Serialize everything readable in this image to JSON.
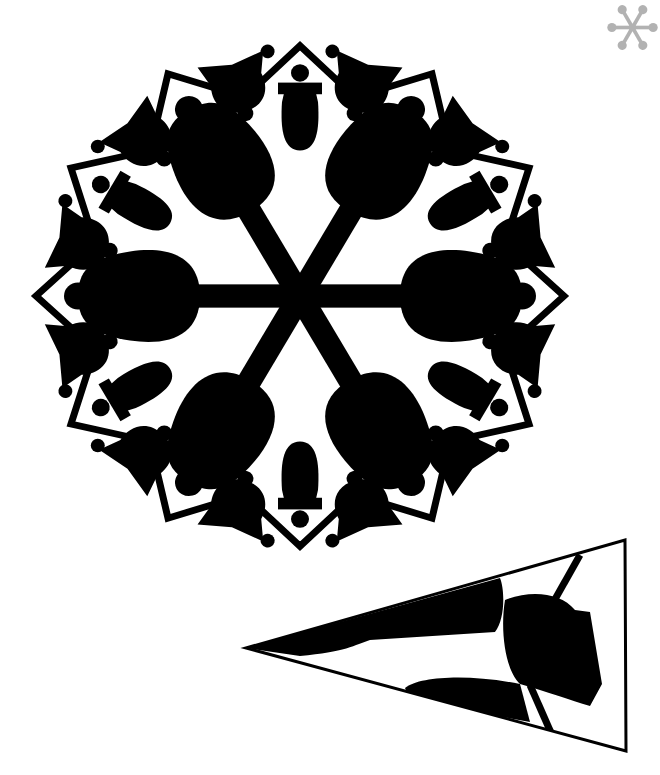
{
  "figure": {
    "ink_color": "#000000",
    "background_color": "#ffffff",
    "thumbnail_color": "#808080"
  },
  "snowflake": {
    "center": [
      300,
      296
    ],
    "arms": 6,
    "outer_radius": 258,
    "bell_pairs": 6,
    "frame_points": 12
  },
  "fold_guide": {
    "triangle": [
      [
        246,
        648
      ],
      [
        625,
        540
      ],
      [
        626,
        751
      ]
    ],
    "label": "folded wedge pattern"
  }
}
